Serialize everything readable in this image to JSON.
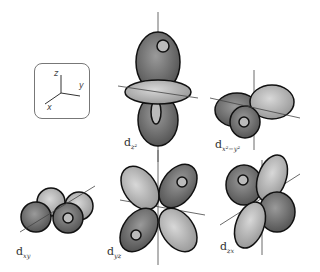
{
  "figure": {
    "axes_inset": {
      "z": "z",
      "y": "y",
      "x": "x"
    },
    "orbitals": [
      {
        "name": "d",
        "subscript": "z²"
      },
      {
        "name": "d",
        "subscript": "x²−y²"
      },
      {
        "name": "d",
        "subscript": "xy"
      },
      {
        "name": "d",
        "subscript": "yz"
      },
      {
        "name": "d",
        "subscript": "zx"
      }
    ]
  },
  "colors": {
    "lobe_dark": "#7a7a7a",
    "lobe_light": "#c4c4c4",
    "outline": "#111111"
  }
}
